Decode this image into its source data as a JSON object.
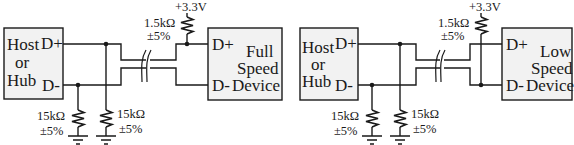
{
  "diagram": {
    "type": "circuit-schematic",
    "top_cropped_fragment": "",
    "left": {
      "name": "full-speed",
      "host": {
        "lines": [
          "Host",
          "or",
          "Hub"
        ],
        "pin_dp": "D+",
        "pin_dm": "D-"
      },
      "device": {
        "lines": [
          "Full",
          "Speed",
          "Device"
        ],
        "pin_dp": "D+",
        "pin_dm": "D-"
      },
      "pullup": {
        "supply": "+3.3V",
        "value": "1.5kΩ",
        "tolerance": "±5%",
        "connected_to": "D+"
      },
      "pulldown_dm": {
        "value": "15kΩ",
        "tolerance": "±5%"
      },
      "pulldown_dp": {
        "value": "15kΩ",
        "tolerance": "±5%"
      }
    },
    "right": {
      "name": "low-speed",
      "host": {
        "lines": [
          "Host",
          "or",
          "Hub"
        ],
        "pin_dp": "D+",
        "pin_dm": "D-"
      },
      "device": {
        "lines": [
          "Low",
          "Speed",
          "Device"
        ],
        "pin_dp": "D+",
        "pin_dm": "D-"
      },
      "pullup": {
        "supply": "+3.3V",
        "value": "1.5kΩ",
        "tolerance": "±5%",
        "connected_to": "D-"
      },
      "pulldown_dm": {
        "value": "15kΩ",
        "tolerance": "±5%"
      },
      "pulldown_dp": {
        "value": "15kΩ",
        "tolerance": "±5%"
      }
    }
  }
}
